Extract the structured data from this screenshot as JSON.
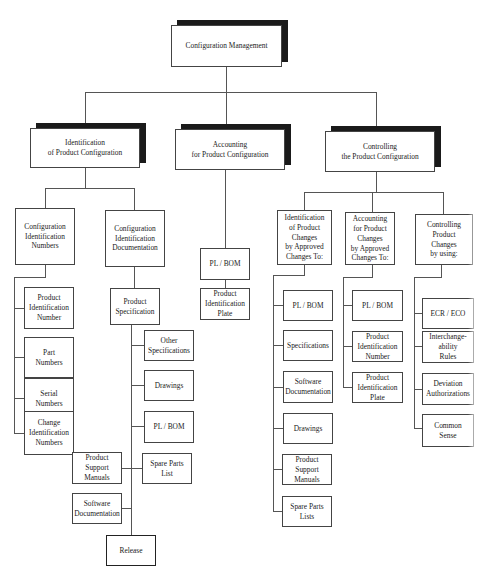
{
  "diagram": {
    "type": "org-chart",
    "root": {
      "label": "Configuration Management"
    },
    "branches": [
      {
        "label": "Identification\nof Product Configuration",
        "children": [
          {
            "label": "Configuration\nIdentification\nNumbers",
            "children": [
              "Product\nIdentification\nNumber",
              "Part\nNumbers",
              "Serial\nNumbers",
              "Change\nIdentification\nNumbers"
            ]
          },
          {
            "label": "Configuration\nIdentification\nDocumentation",
            "children": [
              {
                "label": "Product\nSpecification",
                "children": [
                  "Other\nSpecifications",
                  "Drawings",
                  "PL / BOM",
                  "Spare Parts\nList",
                  "Product\nSupport\nManuals",
                  "Software\nDocumentation",
                  "Release"
                ]
              }
            ]
          }
        ]
      },
      {
        "label": "Accounting\nfor Product Configuration",
        "children": [
          "PL / BOM",
          "Product\nIdentification\nPlate"
        ]
      },
      {
        "label": "Controlling\nthe Product Configuration",
        "children": [
          {
            "label": "Identification\nof Product\nChanges\nby Approved\nChanges To:",
            "children": [
              "PL / BOM",
              "Specifications",
              "Software\nDocumentation",
              "Drawings",
              "Product\nSupport\nManuals",
              "Spare Parts\nLists"
            ]
          },
          {
            "label": "Accounting\nfor Product\nChanges\nby Approved\nChanges To:",
            "children": [
              "PL / BOM",
              "Product\nIdentification\nNumber",
              "Product\nIdentification\nPlate"
            ]
          },
          {
            "label": "Controlling\nProduct\nChanges\nby using:",
            "children": [
              "ECR / ECO",
              "Interchange-\nability\nRules",
              "Deviation\nAuthorizations",
              "Common\nSense"
            ]
          }
        ]
      }
    ]
  },
  "colors": {
    "line": "#555555",
    "border": "#444444",
    "shadow": "#1a1a1a",
    "background": "#ffffff"
  }
}
